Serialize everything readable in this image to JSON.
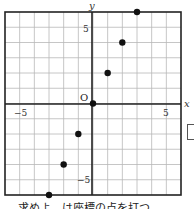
{
  "chart_data": {
    "type": "scatter",
    "title": "",
    "xlabel": "x",
    "ylabel": "y",
    "origin_label": "O",
    "xlim": [
      -6,
      6
    ],
    "ylim": [
      -6,
      6
    ],
    "grid": true,
    "x_tick_labels": [
      "-5",
      "5"
    ],
    "y_tick_labels": [
      "5",
      "-5"
    ],
    "points": [
      {
        "x": -3,
        "y": -6
      },
      {
        "x": -2,
        "y": -4
      },
      {
        "x": -1,
        "y": -2
      },
      {
        "x": 0,
        "y": 0
      },
      {
        "x": 1,
        "y": 2
      },
      {
        "x": 2,
        "y": 4
      },
      {
        "x": 3,
        "y": 6
      }
    ]
  },
  "labels": {
    "x_axis": "x",
    "y_axis": "y",
    "origin": "O",
    "x_neg5": "−5",
    "x_pos5": "5",
    "y_pos5": "5",
    "y_neg5": "−5"
  },
  "caption": "求めよ　は座標の点を打つ"
}
